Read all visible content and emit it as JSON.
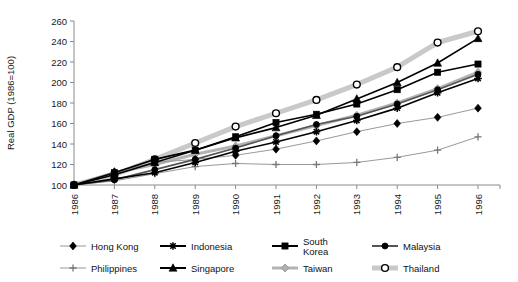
{
  "chart_data": {
    "type": "line",
    "title": "",
    "xlabel": "",
    "ylabel": "Real GDP (1986=100)",
    "xlim": [
      1986,
      1996
    ],
    "ylim": [
      100,
      260
    ],
    "ytick_step": 20,
    "yticks": [
      100,
      120,
      140,
      160,
      180,
      200,
      220,
      240,
      260
    ],
    "categories": [
      1986,
      1987,
      1988,
      1989,
      1990,
      1991,
      1992,
      1993,
      1994,
      1995,
      1996
    ],
    "xticks": [
      "1986",
      "1987",
      "1988",
      "1989",
      "1990",
      "1991",
      "1992",
      "1993",
      "1994",
      "1995",
      "1996"
    ],
    "grid": false,
    "legend_position": "bottom",
    "series": [
      {
        "name": "Hong Kong",
        "marker": "diamond",
        "color": "#000000",
        "line_color": "#999999",
        "values": [
          100,
          113,
          122,
          125,
          129,
          135,
          143,
          152,
          160,
          166,
          175
        ]
      },
      {
        "name": "Indonesia",
        "marker": "star",
        "color": "#000000",
        "line_color": "#000000",
        "values": [
          100,
          106,
          112,
          122,
          133,
          142,
          152,
          163,
          175,
          190,
          204
        ]
      },
      {
        "name": "South Korea",
        "marker": "square",
        "color": "#000000",
        "line_color": "#000000",
        "values": [
          100,
          112,
          125,
          134,
          147,
          161,
          169,
          179,
          193,
          210,
          218
        ]
      },
      {
        "name": "Malaysia",
        "marker": "circle-filled",
        "color": "#000000",
        "line_color": "#555555",
        "values": [
          100,
          105,
          115,
          125,
          136,
          148,
          159,
          167,
          179,
          193,
          208
        ]
      },
      {
        "name": "Philippines",
        "marker": "plus",
        "color": "#777777",
        "line_color": "#999999",
        "values": [
          100,
          104,
          111,
          118,
          121,
          120,
          120,
          122,
          127,
          134,
          147
        ]
      },
      {
        "name": "Singapore",
        "marker": "triangle",
        "color": "#000000",
        "line_color": "#000000",
        "values": [
          100,
          110,
          122,
          134,
          146,
          156,
          168,
          184,
          200,
          219,
          243
        ]
      },
      {
        "name": "Taiwan",
        "marker": "diamond-grey",
        "color": "#b3b3b3",
        "line_color": "#b3b3b3",
        "values": [
          100,
          112,
          120,
          130,
          138,
          148,
          158,
          168,
          180,
          194,
          210
        ]
      },
      {
        "name": "Thailand",
        "marker": "circle-open",
        "color": "#000000",
        "line_color": "#c9c9c9",
        "values": [
          100,
          110,
          125,
          141,
          157,
          170,
          183,
          198,
          215,
          239,
          250
        ]
      }
    ]
  },
  "legend": {
    "items": [
      {
        "label": "Hong Kong"
      },
      {
        "label": "Indonesia"
      },
      {
        "label": "South Korea"
      },
      {
        "label": "Malaysia"
      },
      {
        "label": "Philippines"
      },
      {
        "label": "Singapore"
      },
      {
        "label": "Taiwan"
      },
      {
        "label": "Thailand"
      }
    ]
  }
}
